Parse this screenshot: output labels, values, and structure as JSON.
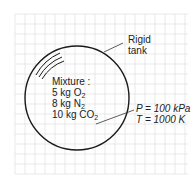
{
  "diagram": {
    "tank_label_line1": "Rigid",
    "tank_label_line2": "tank",
    "mixture_title": "Mixture :",
    "components": [
      {
        "mass": "5 kg O",
        "sub": "2"
      },
      {
        "mass": "8 kg N",
        "sub": "2"
      },
      {
        "mass": "10 kg CO",
        "sub": "2"
      }
    ],
    "pressure": "P = 100 kPa",
    "temperature": "T = 1000 K"
  },
  "colors": {
    "grid": "#d9d9d9",
    "outline": "#1a1a1a",
    "text": "#222222"
  }
}
